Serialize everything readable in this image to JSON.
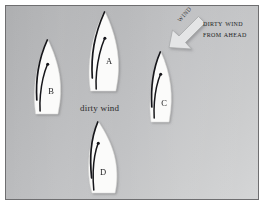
{
  "figure": {
    "background_color": "#bbbcbe",
    "border_color": "#6e6e70",
    "matte_color": "#ffffff"
  },
  "annotations": {
    "dirty_wind_caption": "dirty wind",
    "from_ahead_line1": "Dirty wind",
    "from_ahead_line2": "from ahead",
    "wind_arrow_label": "Wind"
  },
  "wind_arrow": {
    "name": "wind-arrow",
    "direction": "down-left",
    "fill_color": "#e2e3e4",
    "outline_color": "#9a9b9d"
  },
  "boats": [
    {
      "id": "A",
      "label": "A",
      "position": "center-top",
      "hull_color": "#fbfbfa",
      "sail_line_color": "#1a1a1c",
      "label_x": 103,
      "label_y": 58
    },
    {
      "id": "B",
      "label": "B",
      "position": "left",
      "hull_color": "#fbfbfa",
      "sail_line_color": "#1a1a1c",
      "label_x": 45,
      "label_y": 88
    },
    {
      "id": "C",
      "label": "C",
      "position": "right-center",
      "hull_color": "#fbfbfa",
      "sail_line_color": "#1a1a1c",
      "label_x": 158,
      "label_y": 100
    },
    {
      "id": "D",
      "label": "D",
      "position": "center-bottom",
      "hull_color": "#fbfbfa",
      "sail_line_color": "#1a1a1c",
      "label_x": 97,
      "label_y": 169
    }
  ]
}
